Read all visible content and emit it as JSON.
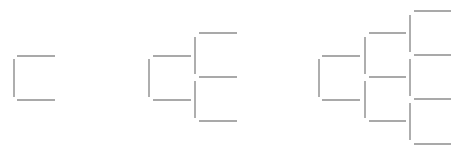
{
  "diagram": {
    "type": "recursive-bracket-fractal",
    "line_color": "#8c8c8c",
    "background": "#ffffff",
    "stages": [
      {
        "name": "iteration-1",
        "segments": [
          {
            "x1": 14,
            "y1": 59,
            "x2": 14,
            "y2": 97
          },
          {
            "x1": 17,
            "y1": 56,
            "x2": 55,
            "y2": 56
          },
          {
            "x1": 17,
            "y1": 100,
            "x2": 55,
            "y2": 100
          }
        ]
      },
      {
        "name": "iteration-2",
        "segments": [
          {
            "x1": 149,
            "y1": 59,
            "x2": 149,
            "y2": 97
          },
          {
            "x1": 153,
            "y1": 56,
            "x2": 191,
            "y2": 56
          },
          {
            "x1": 153,
            "y1": 100,
            "x2": 191,
            "y2": 100
          },
          {
            "x1": 195,
            "y1": 37,
            "x2": 195,
            "y2": 74
          },
          {
            "x1": 195,
            "y1": 81,
            "x2": 195,
            "y2": 118
          },
          {
            "x1": 199,
            "y1": 33,
            "x2": 237,
            "y2": 33
          },
          {
            "x1": 199,
            "y1": 77,
            "x2": 237,
            "y2": 77
          },
          {
            "x1": 199,
            "y1": 121,
            "x2": 237,
            "y2": 121
          }
        ]
      },
      {
        "name": "iteration-3",
        "segments": [
          {
            "x1": 319,
            "y1": 59,
            "x2": 319,
            "y2": 97
          },
          {
            "x1": 322,
            "y1": 56,
            "x2": 360,
            "y2": 56
          },
          {
            "x1": 322,
            "y1": 100,
            "x2": 360,
            "y2": 100
          },
          {
            "x1": 365,
            "y1": 37,
            "x2": 365,
            "y2": 74
          },
          {
            "x1": 365,
            "y1": 81,
            "x2": 365,
            "y2": 118
          },
          {
            "x1": 369,
            "y1": 33,
            "x2": 406,
            "y2": 33
          },
          {
            "x1": 369,
            "y1": 77,
            "x2": 406,
            "y2": 77
          },
          {
            "x1": 369,
            "y1": 121,
            "x2": 406,
            "y2": 121
          },
          {
            "x1": 410,
            "y1": 15,
            "x2": 410,
            "y2": 52
          },
          {
            "x1": 410,
            "y1": 59,
            "x2": 410,
            "y2": 96
          },
          {
            "x1": 410,
            "y1": 103,
            "x2": 410,
            "y2": 140
          },
          {
            "x1": 414,
            "y1": 11,
            "x2": 451,
            "y2": 11
          },
          {
            "x1": 414,
            "y1": 55,
            "x2": 451,
            "y2": 55
          },
          {
            "x1": 414,
            "y1": 99,
            "x2": 451,
            "y2": 99
          },
          {
            "x1": 414,
            "y1": 144,
            "x2": 451,
            "y2": 144
          }
        ]
      }
    ]
  }
}
